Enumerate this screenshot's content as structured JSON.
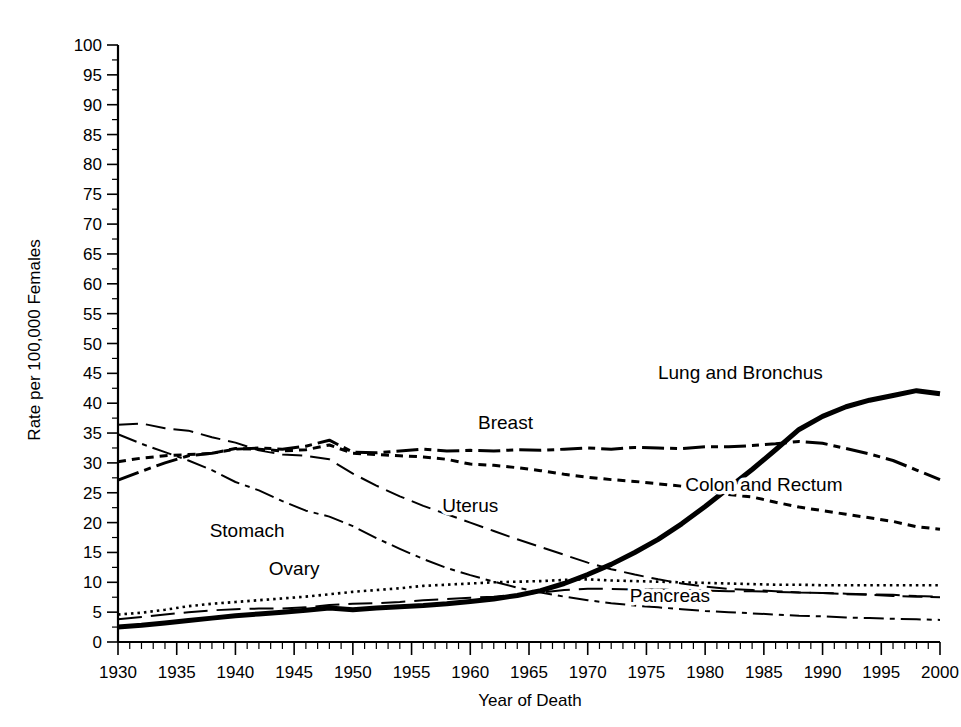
{
  "chart_data": {
    "type": "line",
    "title": "",
    "xlabel": "Year of Death",
    "ylabel": "Rate per 100,000 Females",
    "xlim": [
      1930,
      2000
    ],
    "ylim": [
      0,
      100
    ],
    "xticks": [
      1930,
      1935,
      1940,
      1945,
      1950,
      1955,
      1960,
      1965,
      1970,
      1975,
      1980,
      1985,
      1990,
      1995,
      2000
    ],
    "yticks": [
      0,
      5,
      10,
      15,
      20,
      25,
      30,
      35,
      40,
      45,
      50,
      55,
      60,
      65,
      70,
      75,
      80,
      85,
      90,
      95,
      100
    ],
    "x_minor_step": 1,
    "y_minor_step": 2.5,
    "grid": false,
    "legend": "inline-labels",
    "x": [
      1930,
      1932,
      1934,
      1936,
      1938,
      1940,
      1942,
      1944,
      1946,
      1948,
      1950,
      1952,
      1954,
      1956,
      1958,
      1960,
      1962,
      1964,
      1966,
      1968,
      1970,
      1972,
      1974,
      1976,
      1978,
      1980,
      1982,
      1984,
      1986,
      1988,
      1990,
      1992,
      1994,
      1996,
      1998,
      2000
    ],
    "series": [
      {
        "name": "Lung and Bronchus",
        "style": "solid-thick",
        "label_x": 1983,
        "label_y": 44.0,
        "values": [
          2.5,
          2.8,
          3.2,
          3.6,
          4.0,
          4.4,
          4.7,
          5.0,
          5.3,
          5.7,
          5.4,
          5.7,
          5.9,
          6.1,
          6.4,
          6.8,
          7.2,
          7.8,
          8.6,
          9.8,
          11.3,
          13.0,
          15.0,
          17.2,
          19.8,
          22.7,
          25.8,
          28.9,
          32.2,
          35.6,
          37.8,
          39.4,
          40.5,
          41.3,
          42.1,
          41.6
        ]
      },
      {
        "name": "Breast",
        "style": "dashdot-thick",
        "label_x": 1963,
        "label_y": 35.6,
        "values": [
          27.1,
          28.6,
          30.0,
          31.2,
          31.6,
          32.3,
          32.5,
          32.3,
          32.8,
          33.8,
          31.8,
          31.7,
          32.0,
          32.3,
          32.0,
          32.1,
          32.0,
          32.2,
          32.1,
          32.3,
          32.5,
          32.3,
          32.6,
          32.5,
          32.4,
          32.7,
          32.7,
          32.9,
          33.2,
          33.6,
          33.3,
          32.4,
          31.5,
          30.4,
          28.8,
          27.2
        ]
      },
      {
        "name": "Colon and Rectum",
        "style": "dotted-dash",
        "label_x": 1985,
        "label_y": 25.3,
        "values": [
          30.2,
          30.8,
          31.2,
          31.4,
          31.6,
          32.4,
          32.3,
          32.0,
          32.2,
          33.0,
          31.6,
          31.4,
          31.2,
          31.0,
          30.6,
          29.8,
          29.6,
          29.2,
          28.7,
          28.1,
          27.6,
          27.2,
          26.9,
          26.5,
          26.1,
          25.3,
          24.7,
          24.3,
          23.4,
          22.6,
          22.0,
          21.4,
          20.8,
          20.2,
          19.3,
          18.9
        ]
      },
      {
        "name": "Uterus",
        "style": "longdash-thin",
        "label_x": 1960,
        "label_y": 21.8,
        "values": [
          36.4,
          36.6,
          35.8,
          35.4,
          34.3,
          33.4,
          32.1,
          31.4,
          31.2,
          30.6,
          28.2,
          26.2,
          24.4,
          22.8,
          21.4,
          20.0,
          18.6,
          17.2,
          15.9,
          14.6,
          13.3,
          12.2,
          11.3,
          10.5,
          9.8,
          9.3,
          8.9,
          8.7,
          8.5,
          8.3,
          8.2,
          8.0,
          7.9,
          7.7,
          7.6,
          7.5
        ]
      },
      {
        "name": "Stomach",
        "style": "dashdot-thin",
        "label_x": 1941,
        "label_y": 17.6,
        "values": [
          34.8,
          33.2,
          31.8,
          30.4,
          28.8,
          26.8,
          25.4,
          23.6,
          22.0,
          21.0,
          19.4,
          17.4,
          15.6,
          13.9,
          12.4,
          11.2,
          10.1,
          9.1,
          8.3,
          7.6,
          7.0,
          6.5,
          6.1,
          5.8,
          5.5,
          5.2,
          5.0,
          4.8,
          4.6,
          4.4,
          4.3,
          4.1,
          4.0,
          3.9,
          3.8,
          3.7
        ]
      },
      {
        "name": "Ovary",
        "style": "dotted",
        "label_x": 1945,
        "label_y": 11.3,
        "values": [
          4.6,
          4.9,
          5.4,
          6.0,
          6.4,
          6.7,
          7.0,
          7.3,
          7.6,
          8.0,
          8.4,
          8.7,
          9.0,
          9.4,
          9.6,
          9.8,
          10.0,
          10.1,
          10.2,
          10.4,
          10.5,
          10.3,
          10.2,
          10.1,
          10.0,
          9.9,
          9.8,
          9.7,
          9.6,
          9.6,
          9.5,
          9.5,
          9.5,
          9.5,
          9.5,
          9.5
        ]
      },
      {
        "name": "Pancreas",
        "style": "longdash-thin2",
        "label_x": 1977,
        "label_y": 6.7,
        "values": [
          3.8,
          4.2,
          4.6,
          5.0,
          5.3,
          5.5,
          5.6,
          5.6,
          5.8,
          6.2,
          6.4,
          6.5,
          6.7,
          7.0,
          7.2,
          7.4,
          7.6,
          7.9,
          8.3,
          8.7,
          8.9,
          8.9,
          8.8,
          8.8,
          8.7,
          8.6,
          8.5,
          8.5,
          8.4,
          8.3,
          8.2,
          8.1,
          8.0,
          7.9,
          7.7,
          7.6
        ]
      }
    ]
  }
}
